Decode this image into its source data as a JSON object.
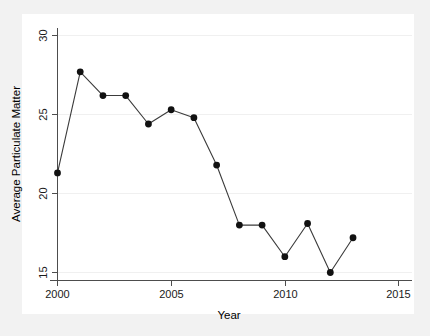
{
  "chart_data": {
    "type": "line",
    "title": "",
    "xlabel": "Year",
    "ylabel": "Average Particulate Matter",
    "x": [
      2000,
      2001,
      2002,
      2003,
      2004,
      2005,
      2006,
      2007,
      2008,
      2009,
      2010,
      2011,
      2012,
      2013
    ],
    "values": [
      21.3,
      27.7,
      26.2,
      26.2,
      24.4,
      25.3,
      24.8,
      21.8,
      18.0,
      18.0,
      16.0,
      18.1,
      15.0,
      17.2
    ],
    "series": [
      {
        "name": "Average Particulate Matter",
        "values": [
          21.3,
          27.7,
          26.2,
          26.2,
          24.4,
          25.3,
          24.8,
          21.8,
          18.0,
          18.0,
          16.0,
          18.1,
          15.0,
          17.2
        ]
      }
    ],
    "xlim": [
      2000,
      2015
    ],
    "ylim": [
      14.5,
      30.2
    ],
    "xticks": [
      2000,
      2005,
      2010,
      2015
    ],
    "xtick_labels": [
      "2000",
      "2005",
      "2010",
      "2015"
    ],
    "yticks": [
      15,
      20,
      25,
      30
    ],
    "ytick_labels": [
      "15",
      "20",
      "25",
      "30"
    ],
    "grid": true,
    "legend": "none",
    "marker": "filled-circle",
    "line_color": "#3b3b3b",
    "marker_color": "#111111",
    "panel_background": "#ffffff",
    "figure_background": "#f2f2f2"
  },
  "axes": {
    "x_title": "Year",
    "y_title": "Average Particulate Matter"
  },
  "x_tick_labels": {
    "0": "2000",
    "1": "2005",
    "2": "2010",
    "3": "2015"
  },
  "y_tick_labels": {
    "0": "15",
    "1": "20",
    "2": "25",
    "3": "30"
  }
}
